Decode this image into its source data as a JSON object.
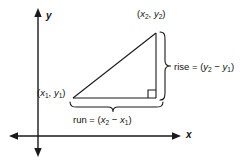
{
  "figure": {
    "stroke_color": "#1a1a1a",
    "background_color": "#ffffff"
  },
  "axes": {
    "x_label": "x",
    "y_label": "y",
    "x_axis_y": 136,
    "y_axis_x": 38,
    "x_range_px": [
      10,
      178
    ],
    "y_range_px": [
      10,
      155
    ]
  },
  "triangle": {
    "vertex_left": {
      "x": 73,
      "y": 98
    },
    "vertex_top_right": {
      "x": 156,
      "y": 33
    },
    "vertex_bottom_right": {
      "x": 156,
      "y": 98
    },
    "right_angle_marker": true
  },
  "labels": {
    "point2": {
      "open": "(",
      "x_var": "x",
      "x_sub": "2",
      "comma": ", ",
      "y_var": "y",
      "y_sub": "2",
      "close": ")"
    },
    "point1": {
      "open": "(",
      "x_var": "x",
      "x_sub": "1",
      "comma": ", ",
      "y_var": "y",
      "y_sub": "1",
      "close": ")"
    },
    "rise": {
      "name": "rise",
      "equals": " = (",
      "minuend_var": "y",
      "minuend_sub": "2",
      "minus": " − ",
      "subtrahend_var": "y",
      "subtrahend_sub": "1",
      "close": ")"
    },
    "run": {
      "name": "run",
      "equals": " = (",
      "minuend_var": "x",
      "minuend_sub": "2",
      "minus": " − ",
      "subtrahend_var": "x",
      "subtrahend_sub": "1",
      "close": ")"
    }
  },
  "braces": {
    "rise_brace": {
      "orientation": "vertical-right",
      "from_y": 32,
      "to_y": 100,
      "tip_x": 172
    },
    "run_brace": {
      "orientation": "horizontal-bottom",
      "from_x": 70,
      "to_x": 163,
      "tip_y": 113
    }
  }
}
